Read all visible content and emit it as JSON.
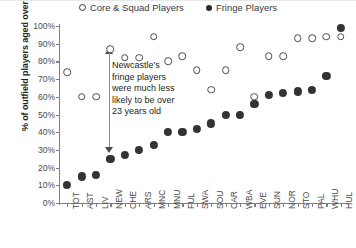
{
  "chart_data": {
    "type": "scatter",
    "title": "",
    "xlabel": "",
    "ylabel": "% of outfield players aged over 23",
    "ylim": [
      0,
      100
    ],
    "ytick_labels": [
      "100%",
      "90%",
      "80%",
      "70%",
      "60%",
      "50%",
      "40%",
      "30%",
      "20%",
      "10%",
      "0%"
    ],
    "ytick_values": [
      100,
      90,
      80,
      70,
      60,
      50,
      40,
      30,
      20,
      10,
      0
    ],
    "grid": false,
    "legend_position": "top-center",
    "categories": [
      "TOT",
      "AST",
      "LIV",
      "NEW",
      "CHE",
      "ARS",
      "MNC",
      "MNU",
      "FUL",
      "SWA",
      "SOU",
      "CAR",
      "WBA",
      "EVE",
      "SUN",
      "NOR",
      "STO",
      "PAL",
      "WHU",
      "HUL"
    ],
    "series": [
      {
        "name": "Core & Squad Players",
        "marker": "hollow-circle",
        "color": "#4a4a4a",
        "values": [
          74,
          60,
          60,
          87,
          82,
          82,
          94,
          80,
          83,
          75,
          64,
          75,
          88,
          60,
          83,
          83,
          93,
          93,
          94,
          94
        ]
      },
      {
        "name": "Fringe Players",
        "marker": "solid-circle",
        "color": "#333333",
        "values": [
          10,
          15,
          16,
          25,
          27,
          30,
          33,
          40,
          40,
          42,
          45,
          50,
          50,
          56,
          61,
          62,
          63,
          64,
          72,
          99
        ]
      }
    ],
    "annotations": [
      {
        "text": "Newcastle's fringe players were much less likely to be over 23 years old",
        "lines": [
          "Newcastle's",
          "fringe players",
          "were much less",
          "likely to be over",
          "23 years old"
        ],
        "attached_category": "NEW",
        "arrow": {
          "type": "double-headed-vertical",
          "from_value": 87,
          "to_value": 25
        }
      }
    ]
  },
  "legend": {
    "items": [
      {
        "label": "Core & Squad Players",
        "marker": "hollow-circle"
      },
      {
        "label": "Fringe Players",
        "marker": "solid-circle"
      }
    ]
  }
}
